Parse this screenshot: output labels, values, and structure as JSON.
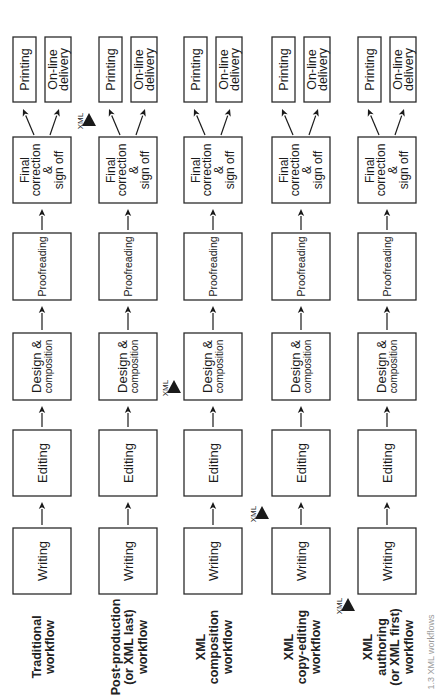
{
  "diagram": {
    "orientation": "rotated-90-ccw",
    "stages": {
      "writing": "Writing",
      "editing": "Editing",
      "design_line1": "Design &",
      "design_line2": "composition",
      "proofreading": "Proofreading",
      "final_line1": "Final",
      "final_line2": "correction",
      "final_line3": "&",
      "final_line4": "sign off",
      "printing": "Printing",
      "online_line1": "On-line",
      "online_line2": "delivery"
    },
    "xml_marker_label": "XML",
    "workflows": [
      {
        "id": "traditional",
        "label_lines": [
          "Traditional",
          "workflow"
        ],
        "xml_after_stage": null
      },
      {
        "id": "post-production",
        "label_lines": [
          "Post-production",
          "(or XML last)",
          "workflow"
        ],
        "xml_after_stage": "final"
      },
      {
        "id": "xml-composition",
        "label_lines": [
          "XML",
          "composition",
          "workflow"
        ],
        "xml_after_stage": "editing"
      },
      {
        "id": "xml-copy-editing",
        "label_lines": [
          "XML",
          "copy-editing",
          "workflow"
        ],
        "xml_after_stage": "writing"
      },
      {
        "id": "xml-authoring",
        "label_lines": [
          "XML",
          "authoring",
          "(or XML first)",
          "workflow"
        ],
        "xml_after_stage": "before-writing"
      }
    ],
    "caption": "1.3 XML workflows"
  }
}
